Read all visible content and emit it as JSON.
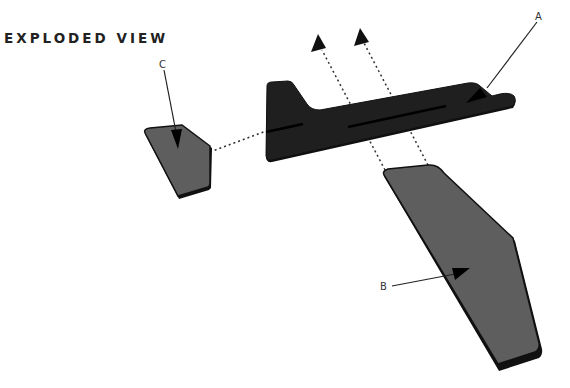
{
  "title": "EXPLODED VIEW",
  "labels": {
    "a": "A",
    "b": "B",
    "c": "C"
  },
  "parts": [
    {
      "id": "A",
      "name": "fuselage",
      "color": "#1f1f1f"
    },
    {
      "id": "B",
      "name": "wing",
      "color": "#5e5e5e"
    },
    {
      "id": "C",
      "name": "tail-stabilizer",
      "color": "#5e5e5e"
    }
  ],
  "colors": {
    "fuselage": "#1f1f1f",
    "wing": "#5e5e5e",
    "edge": "#111111",
    "leader": "#222222",
    "dash": "#333333"
  }
}
